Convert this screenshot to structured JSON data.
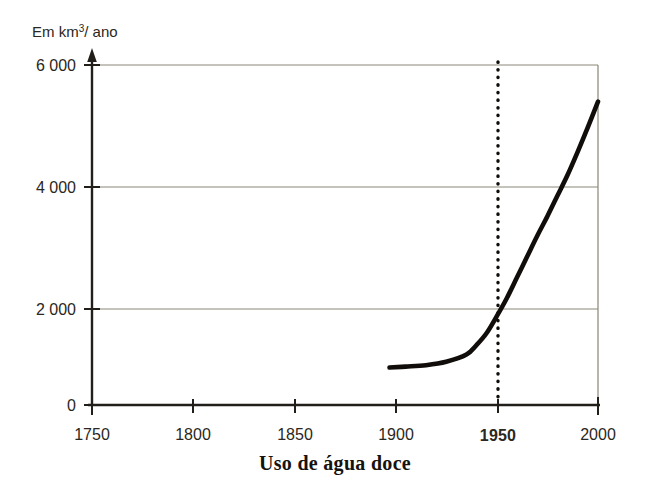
{
  "chart_data": {
    "type": "line",
    "title": "Uso de água doce",
    "ylabel": "Em km3/ ano",
    "ylabel_prefix": "Em km",
    "ylabel_sup": "3",
    "ylabel_suffix": "/ ano",
    "xlabel": "",
    "xlim": [
      1750,
      2000
    ],
    "ylim": [
      0,
      6000
    ],
    "grid": true,
    "legend": false,
    "y_ticks": [
      0,
      2000,
      4000,
      6000
    ],
    "y_tick_labels": [
      "0",
      "2 000",
      "4 000",
      "6 000"
    ],
    "x_ticks": [
      1750,
      1800,
      1850,
      1900,
      1950,
      2000
    ],
    "x_tick_labels": [
      "1750",
      "1800",
      "1850",
      "1900",
      "1950",
      "2000"
    ],
    "x_tick_bold": [
      false,
      false,
      false,
      false,
      true,
      false
    ],
    "annotations": [
      {
        "name": "year-1950-marker",
        "type": "vertical-dotted-line",
        "x": 1950,
        "label": "1950"
      }
    ],
    "series": [
      {
        "name": "Uso de água doce",
        "color": "#100d0a",
        "x": [
          1897,
          1905,
          1915,
          1925,
          1935,
          1940,
          1945,
          1950,
          1955,
          1960,
          1965,
          1970,
          1975,
          1980,
          1985,
          1990,
          1995,
          2000
        ],
        "values": [
          780,
          800,
          830,
          900,
          1050,
          1250,
          1500,
          1850,
          2180,
          2520,
          2860,
          3200,
          3520,
          3860,
          4200,
          4580,
          4980,
          5400
        ]
      }
    ]
  },
  "axes": {
    "y_axis_name": "vertical-value-axis",
    "x_axis_name": "horizontal-year-axis"
  }
}
